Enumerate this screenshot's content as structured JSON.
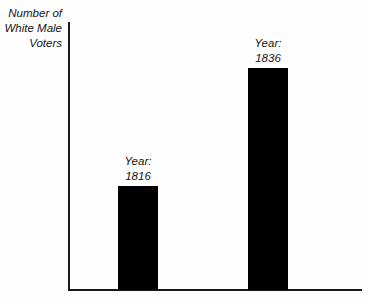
{
  "chart_data": {
    "type": "bar",
    "title": "",
    "xlabel": "",
    "ylabel": "Number of White Male Voters",
    "ylabel_lines": [
      "Number of",
      "White Male",
      "Voters"
    ],
    "categories": [
      "Year: 1816",
      "Year: 1836"
    ],
    "values": [
      104,
      222
    ],
    "value_unit": "relative bar height (px, unlabeled axis)",
    "ylim": [
      0,
      267
    ],
    "grid": false,
    "legend": null,
    "axis_ticks": [],
    "bar_color": "#000000",
    "axis_color": "#1a1a1a",
    "background_color": "#fefefe",
    "annotations": [
      {
        "text_lines": [
          "Year:",
          "1816"
        ],
        "position": "above-bar-1"
      },
      {
        "text_lines": [
          "Year:",
          "1836"
        ],
        "position": "above-bar-2"
      }
    ]
  },
  "bars": [
    {
      "name": "bar-1816",
      "label_lines": [
        "Year:",
        "1816"
      ],
      "label_line_1": "Year:",
      "label_line_2": "1816",
      "left_px": 118,
      "width_px": 40,
      "top_px": 186,
      "height_px": 104,
      "label_left_px": 98,
      "label_top_px": 154,
      "label_width_px": 80
    },
    {
      "name": "bar-1836",
      "label_lines": [
        "Year:",
        "1836"
      ],
      "label_line_1": "Year:",
      "label_line_2": "1836",
      "left_px": 248,
      "width_px": 40,
      "top_px": 68,
      "height_px": 222,
      "label_left_px": 228,
      "label_top_px": 36,
      "label_width_px": 80
    }
  ],
  "axis_label": {
    "line_1": "Number of",
    "line_2": "White Male",
    "line_3": "Voters"
  }
}
